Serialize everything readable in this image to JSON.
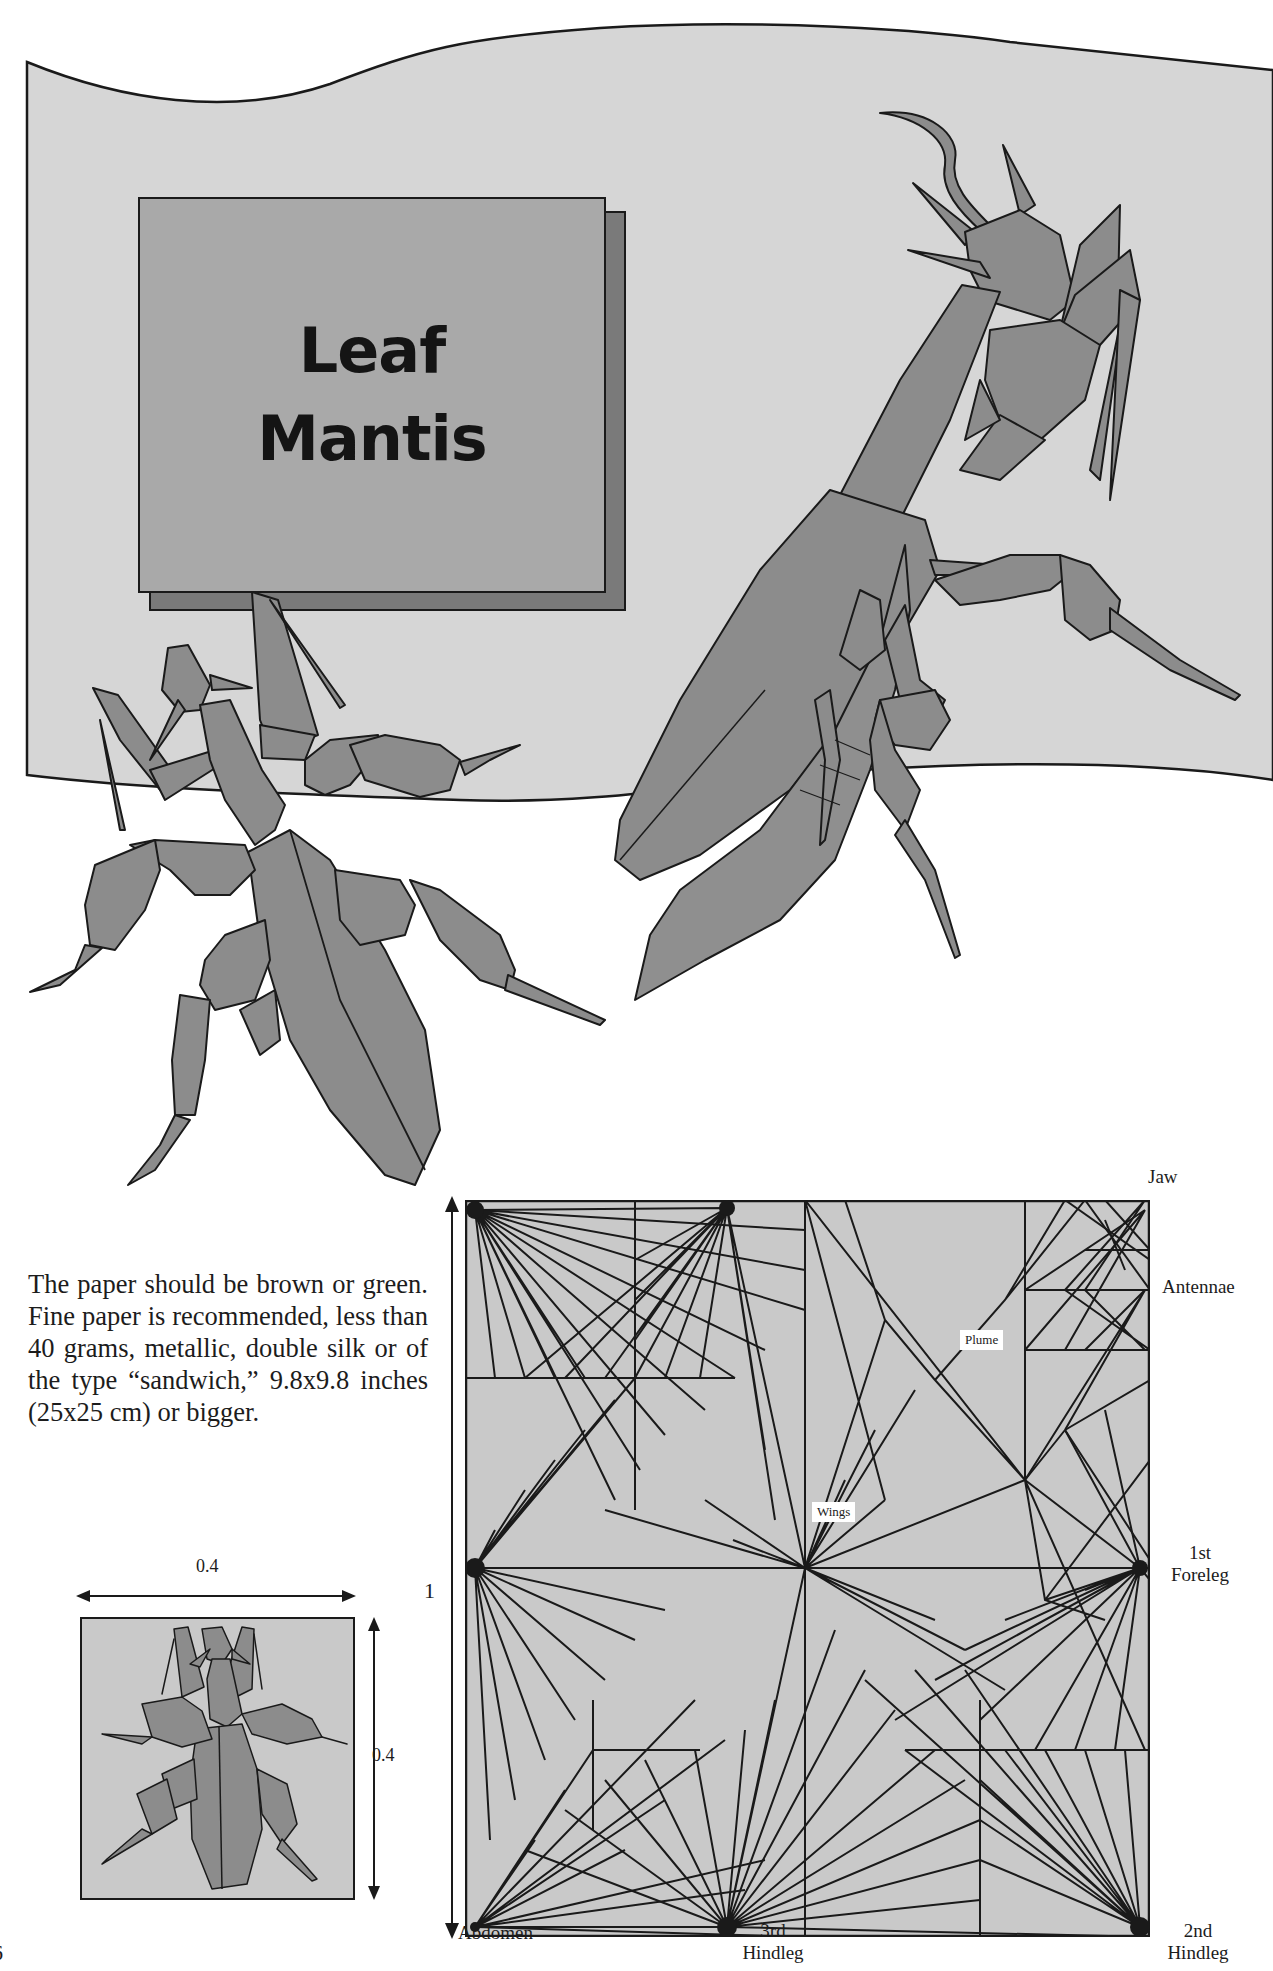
{
  "page": {
    "page_number_fragment": "6",
    "background": "#ffffff",
    "colors": {
      "backdrop": "#d6d6d6",
      "mantis_fill": "#8c8c8c",
      "title_card": "#a9a9a9",
      "title_card_shadow": "#7a7a7a",
      "crease_fill": "#c9c9c9",
      "line": "#1a1a1a"
    }
  },
  "title_card": {
    "line1": "Leaf",
    "line2": "Mantis"
  },
  "intro": {
    "text": "The paper should be brown or green. Fine paper is recommended, less than 40 grams, metallic, double silk or of the type “sandwich,” 9.8x9.8 inches (25x25 cm) or bigger."
  },
  "thumbnail": {
    "width_label": "0.4",
    "height_label": "0.4"
  },
  "crease_pattern": {
    "side_label": "1",
    "flap_labels": {
      "jaw": "Jaw",
      "antennae": "Antennae",
      "foreleg_1_line1": "1st",
      "foreleg_1_line2": "Foreleg",
      "abdomen": "Abdomen",
      "hindleg_3_line1": "3rd",
      "hindleg_3_line2": "Hindleg",
      "hindleg_2_line1": "2nd",
      "hindleg_2_line2": "Hindleg"
    },
    "inner_tags": {
      "plume": "Plume",
      "wings": "Wings"
    }
  }
}
